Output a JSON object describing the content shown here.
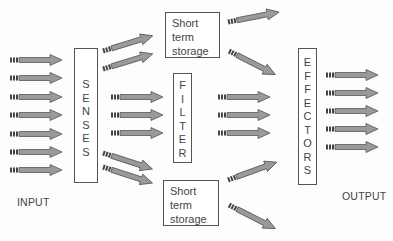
{
  "diagram": {
    "type": "information-processing flow",
    "labels": {
      "input": "INPUT",
      "output": "OUTPUT"
    },
    "blocks": {
      "senses": {
        "letters": "S\nE\nN\nS\nE\nS",
        "name": "SENSES"
      },
      "filter": {
        "letters": "F\nI\nL\nT\nE\nR",
        "name": "FILTER"
      },
      "effectors": {
        "letters": "E\nF\nF\nE\nC\nT\nO\nR\nS",
        "name": "EFFECTORS"
      },
      "storage_top": {
        "text": "Short\nterm\nstorage"
      },
      "storage_bottom": {
        "text": "Short\nterm\nstorage"
      }
    },
    "arrow_counts": {
      "input_to_senses": 7,
      "senses_to_top_storage": 2,
      "senses_to_filter": 3,
      "senses_to_bottom_storage": 2,
      "filter_to_effectors": 3,
      "top_storage_out": 2,
      "bottom_storage_out": 2,
      "effectors_output": 5
    },
    "colors": {
      "arrow_fill": "#9a9a9a",
      "arrow_stroke": "#555555",
      "box_border": "#555555"
    }
  }
}
